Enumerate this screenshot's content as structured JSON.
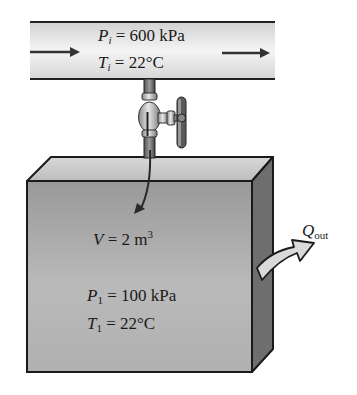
{
  "diagram": {
    "type": "thermodynamics-tank-charging",
    "supply_line": {
      "pressure": {
        "symbol": "P",
        "subscript": "i",
        "eq": " = ",
        "value": "600 kPa"
      },
      "temperature": {
        "symbol": "T",
        "subscript": "i",
        "eq": " = ",
        "value": "22°C"
      },
      "flow_direction": "left-to-right"
    },
    "valve": {
      "label": "valve",
      "state": "open"
    },
    "tank": {
      "volume": {
        "symbol": "V",
        "eq": " = 2 m",
        "sup": "3"
      },
      "initial_pressure": {
        "symbol": "P",
        "subscript": "1",
        "eq": " = ",
        "value": "100 kPa"
      },
      "initial_temperature": {
        "symbol": "T",
        "subscript": "1",
        "eq": " = ",
        "value": "22°C"
      }
    },
    "heat_transfer": {
      "symbol": "Q",
      "subscript": "out",
      "direction": "out"
    },
    "colors": {
      "pipe_fill": "#e4e4e4",
      "outline": "#1a1a1a",
      "tank_front_top": "#9c9c9c",
      "tank_front_bottom": "#bdbdbd",
      "tank_top": "#c8c8c8",
      "tank_side": "#6e6e6e",
      "arrow_fill": "#d9d9d9"
    }
  }
}
